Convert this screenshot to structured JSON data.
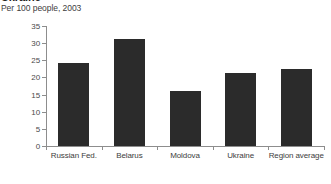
{
  "chart_data": {
    "type": "bar",
    "title": "Ukraine",
    "subtitle": "Per 100 people, 2003",
    "categories": [
      "Russian Fed.",
      "Belarus",
      "Moldova",
      "Ukraine",
      "Region average"
    ],
    "values": [
      24.2,
      31.2,
      16.0,
      21.4,
      22.4
    ],
    "xlabel": "",
    "ylabel": "",
    "ylim": [
      0,
      35
    ],
    "yticks": [
      0,
      5,
      10,
      15,
      20,
      25,
      30,
      35
    ],
    "ytick_labels": [
      "0",
      "5",
      "10",
      "15",
      "20",
      "25",
      "30",
      "35"
    ],
    "grid": false,
    "legend": false,
    "bar_color": "#2b2b2b",
    "axis_color": "#8d8d8d",
    "text_color": "#3d3d3d",
    "background": "#ffffff"
  }
}
